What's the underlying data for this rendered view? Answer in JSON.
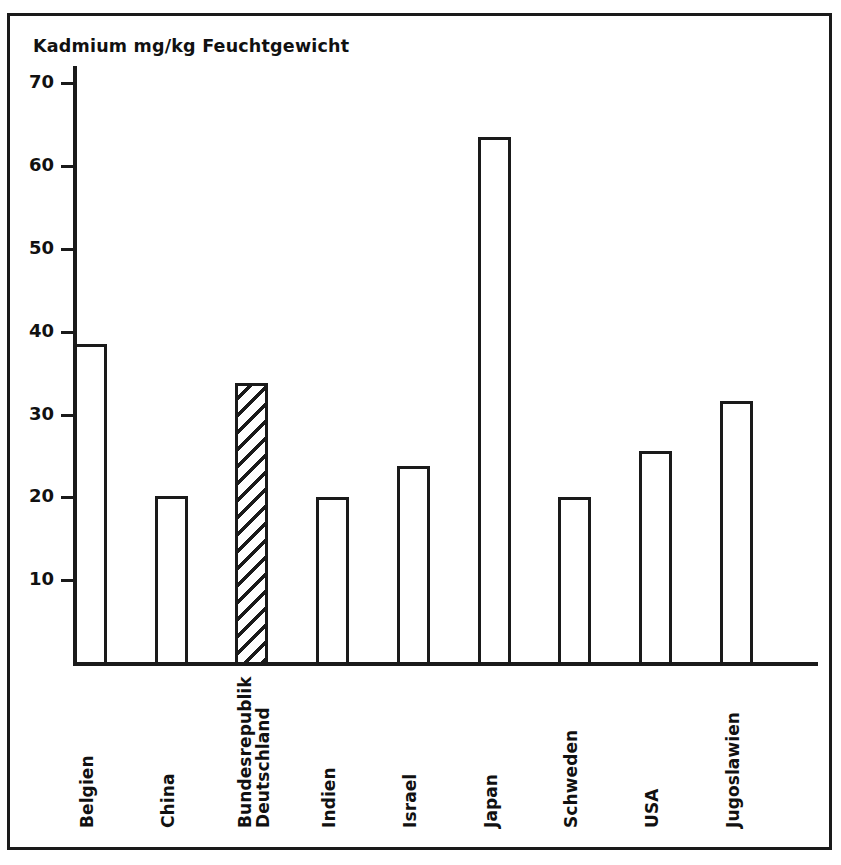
{
  "figure": {
    "title": "Kadmium mg/kg Feuchtgewicht",
    "frame_color": "#1a1a1a",
    "background_color": "#ffffff",
    "highlight_fill": "hatched-diagonal"
  },
  "axes": {
    "y_ticks": [
      "70",
      "60",
      "50",
      "40",
      "30",
      "20",
      "10"
    ],
    "y_tick_values": [
      70,
      60,
      50,
      40,
      30,
      20,
      10
    ]
  },
  "chart_data": {
    "type": "bar",
    "title": "Kadmium mg/kg Feuchtgewicht",
    "xlabel": "",
    "ylabel": "Kadmium mg/kg Feuchtgewicht",
    "ylim": [
      0,
      72
    ],
    "grid": false,
    "legend": null,
    "categories": [
      "Belgien",
      "China",
      "Bundesrepublik Deutschland",
      "Indien",
      "Israel",
      "Japan",
      "Schweden",
      "USA",
      "Jugoslawien"
    ],
    "values": [
      38.5,
      20.2,
      33.8,
      20.0,
      23.8,
      63.5,
      20.0,
      25.6,
      31.7
    ],
    "highlighted_category": "Bundesrepublik Deutschland",
    "bars": [
      {
        "label": "Belgien",
        "label_line1": "Belgien",
        "label_line2": "",
        "value": 38.5,
        "hatched": false
      },
      {
        "label": "China",
        "label_line1": "China",
        "label_line2": "",
        "value": 20.2,
        "hatched": false
      },
      {
        "label": "Bundesrepublik Deutschland",
        "label_line1": "Bundesrepublik",
        "label_line2": "Deutschland",
        "value": 33.8,
        "hatched": true
      },
      {
        "label": "Indien",
        "label_line1": "Indien",
        "label_line2": "",
        "value": 20.0,
        "hatched": false
      },
      {
        "label": "Israel",
        "label_line1": "Israel",
        "label_line2": "",
        "value": 23.8,
        "hatched": false
      },
      {
        "label": "Japan",
        "label_line1": "Japan",
        "label_line2": "",
        "value": 63.5,
        "hatched": false
      },
      {
        "label": "Schweden",
        "label_line1": "Schweden",
        "label_line2": "",
        "value": 20.0,
        "hatched": false
      },
      {
        "label": "USA",
        "label_line1": "USA",
        "label_line2": "",
        "value": 25.6,
        "hatched": false
      },
      {
        "label": "Jugoslawien",
        "label_line1": "Jugoslawien",
        "label_line2": "",
        "value": 31.7,
        "hatched": false
      }
    ]
  }
}
